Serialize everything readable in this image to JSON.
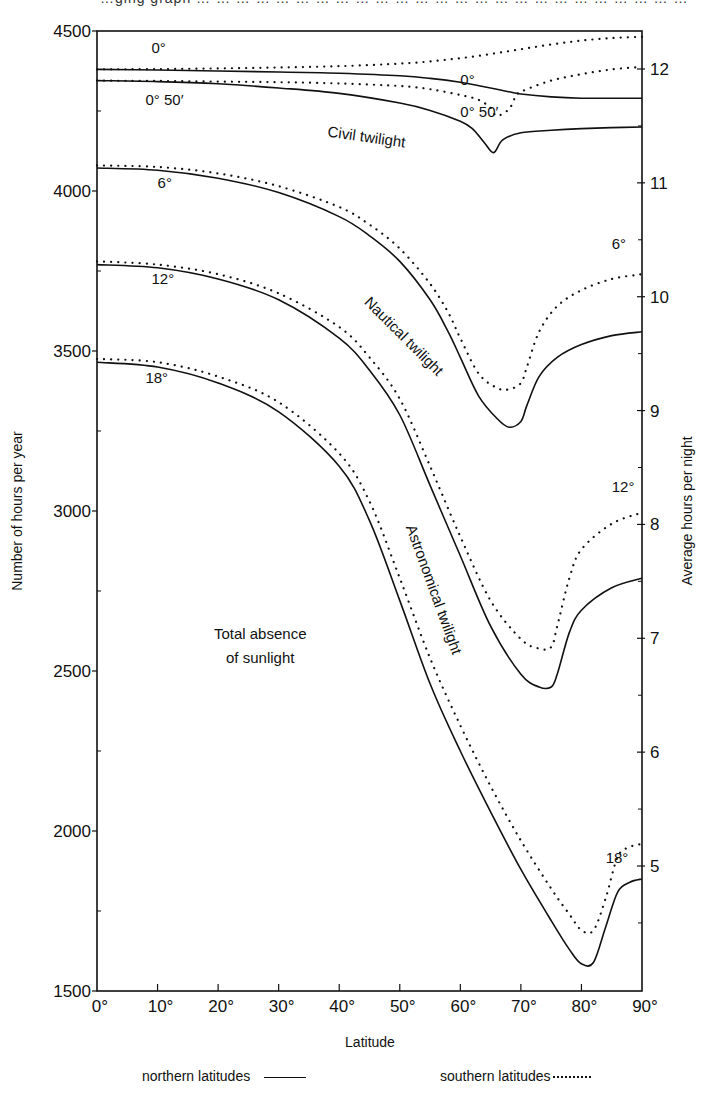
{
  "header_fragment": "…ging graph … … … … … … … … … … … … … … … … … … … … … … … … … … … … … … … … … … … … … … … … … … … … … … … … … … … … … … … … … … … … … … … … … … … … … … … … … … … … … … … … … … … … … … … …  … … ge (up …",
  "legend": {
    "northern": "northern latitudes",
    "southern": "southern latitudes"
  },
  "chart_data": {
    "type": "line",
    "title": "",
    "xlabel": "Latitude",
    "ylabel": "Number of hours per year",
    "ylabel_right": "Average hours per night",
    "xlim": [
      0,
      90
    ],
    "ylim": [
      1500,
      4500
    ],
    "ylim_right_ticks": [
      5,
      6,
      7,
      8,
      9,
      10,
      11,
      12
    ],
    "x_ticks": [
      "0°",
      "10°",
      "20°",
      "30°",
      "40°",
      "50°",
      "60°",
      "70°",
      "80°",
      "90°"
    ],
    "y_ticks": [
      1500,
      2000,
      2500,
      3000,
      3500,
      4000,
      4500
    ],
    "grid": false,
    "legend_position": "bottom",
    "annotations": [
      {
        "text": "0°",
        "x": 9,
        "y": 4430
      },
      {
        "text": "0°",
        "x": 60,
        "y": 4330
      },
      {
        "text": "0° 50′",
        "x": 8,
        "y": 4270
      },
      {
        "text": "0° 50′",
        "x": 60,
        "y": 4230
      },
      {
        "text": "Civil twilight",
        "x": 38,
        "y": 4170
      },
      {
        "text": "6°",
        "x": 10,
        "y": 4010
      },
      {
        "text": "Nautical twilight",
        "x": 44,
        "y": 3650
      },
      {
        "text": "6°",
        "x": 85,
        "y": 3820
      },
      {
        "text": "12°",
        "x": 9,
        "y": 3710
      },
      {
        "text": "Astronomical twilight",
        "x": 51,
        "y": 2950
      },
      {
        "text": "12°",
        "x": 85,
        "y": 3060
      },
      {
        "text": "18°",
        "x": 8,
        "y": 3400
      },
      {
        "text": "Total absence of sunlight",
        "x": 22,
        "y": 2600
      },
      {
        "text": "18°",
        "x": 84,
        "y": 1900
      }
    ],
    "series": [
      {
        "name": "0° (northern)",
        "style": "solid",
        "x": [
          0,
          10,
          20,
          30,
          40,
          50,
          55,
          60,
          65,
          68,
          70,
          75,
          80,
          85,
          90
        ],
        "y": [
          4380,
          4378,
          4375,
          4372,
          4368,
          4360,
          4352,
          4340,
          4322,
          4310,
          4303,
          4294,
          4290,
          4290,
          4290
        ]
      },
      {
        "name": "0° (southern)",
        "style": "dotted",
        "x": [
          0,
          10,
          20,
          30,
          40,
          50,
          55,
          60,
          65,
          70,
          75,
          80,
          85,
          90
        ],
        "y": [
          4380,
          4381,
          4383,
          4386,
          4390,
          4398,
          4405,
          4415,
          4428,
          4443,
          4458,
          4470,
          4478,
          4482
        ]
      },
      {
        "name": "0° 50′ (northern)",
        "style": "solid",
        "x": [
          0,
          10,
          20,
          30,
          40,
          50,
          55,
          60,
          62,
          64,
          65.5,
          67,
          70,
          75,
          80,
          85,
          90
        ],
        "y": [
          4345,
          4342,
          4335,
          4322,
          4305,
          4275,
          4252,
          4218,
          4195,
          4150,
          4120,
          4160,
          4182,
          4190,
          4195,
          4198,
          4200
        ]
      },
      {
        "name": "0° 50′ (southern)",
        "style": "dotted",
        "x": [
          0,
          10,
          20,
          30,
          40,
          50,
          55,
          60,
          63,
          65,
          66,
          68,
          69,
          70,
          75,
          80,
          85,
          90
        ],
        "y": [
          4345,
          4344,
          4342,
          4340,
          4336,
          4328,
          4318,
          4300,
          4285,
          4260,
          4235,
          4255,
          4290,
          4310,
          4345,
          4365,
          4380,
          4388
        ]
      },
      {
        "name": "6° (northern)",
        "style": "solid",
        "x": [
          0,
          10,
          20,
          30,
          40,
          45,
          50,
          55,
          58,
          60,
          63,
          66,
          68,
          70,
          71,
          73,
          76,
          80,
          85,
          90
        ],
        "y": [
          4072,
          4065,
          4040,
          3995,
          3920,
          3860,
          3780,
          3660,
          3560,
          3480,
          3360,
          3290,
          3262,
          3280,
          3330,
          3420,
          3480,
          3520,
          3548,
          3560
        ]
      },
      {
        "name": "6° (southern)",
        "style": "dotted",
        "x": [
          0,
          10,
          20,
          30,
          40,
          45,
          50,
          55,
          58,
          60,
          63,
          66,
          68,
          70,
          71,
          73,
          76,
          80,
          85,
          90
        ],
        "y": [
          4080,
          4075,
          4055,
          4015,
          3950,
          3895,
          3820,
          3710,
          3620,
          3540,
          3430,
          3385,
          3380,
          3400,
          3450,
          3560,
          3640,
          3690,
          3725,
          3740
        ]
      },
      {
        "name": "12° (northern)",
        "style": "solid",
        "x": [
          0,
          10,
          20,
          30,
          40,
          45,
          50,
          55,
          60,
          65,
          70,
          73,
          75,
          76,
          78,
          80,
          85,
          90
        ],
        "y": [
          3770,
          3760,
          3725,
          3660,
          3540,
          3440,
          3300,
          3080,
          2860,
          2640,
          2490,
          2450,
          2450,
          2490,
          2620,
          2690,
          2760,
          2790
        ]
      },
      {
        "name": "12° (southern)",
        "style": "dotted",
        "x": [
          0,
          10,
          20,
          30,
          40,
          45,
          50,
          55,
          60,
          65,
          70,
          73,
          75,
          76,
          78,
          80,
          85,
          90
        ],
        "y": [
          3780,
          3770,
          3740,
          3680,
          3575,
          3480,
          3350,
          3140,
          2920,
          2720,
          2600,
          2570,
          2575,
          2640,
          2790,
          2880,
          2960,
          2995
        ]
      },
      {
        "name": "18° (northern)",
        "style": "solid",
        "x": [
          0,
          10,
          20,
          30,
          40,
          45,
          50,
          55,
          60,
          65,
          70,
          75,
          78,
          80,
          82,
          84,
          86,
          88,
          90
        ],
        "y": [
          3465,
          3450,
          3400,
          3310,
          3140,
          2970,
          2720,
          2460,
          2250,
          2060,
          1880,
          1720,
          1630,
          1585,
          1590,
          1700,
          1810,
          1840,
          1850
        ]
      },
      {
        "name": "18° (southern)",
        "style": "dotted",
        "x": [
          0,
          10,
          20,
          30,
          40,
          45,
          50,
          55,
          60,
          65,
          70,
          75,
          78,
          80,
          82,
          84,
          86,
          88,
          90
        ],
        "y": [
          3475,
          3465,
          3420,
          3340,
          3180,
          3030,
          2790,
          2540,
          2330,
          2140,
          1970,
          1820,
          1740,
          1690,
          1690,
          1790,
          1920,
          1950,
          1960
        ]
      }
    ]
  }
}
